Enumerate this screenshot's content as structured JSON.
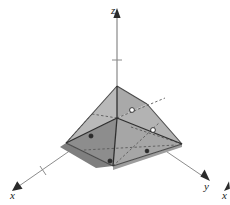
{
  "figure": {
    "kind": "3d-solid-diagram",
    "caption": "",
    "background_color": "#ffffff",
    "width": 230,
    "height": 205
  },
  "axes": {
    "origin": {
      "x": 117,
      "y": 118
    },
    "items": [
      {
        "name": "z",
        "label": "z",
        "label_pos": {
          "x": 111,
          "y": 14
        },
        "line": {
          "x1": 117,
          "y1": 118,
          "x2": 117,
          "y2": 17
        },
        "arrow_points": "117,8 113.4,18 120.6,18",
        "ticks": [
          {
            "x1": 112,
            "y1": 60,
            "x2": 122,
            "y2": 60
          }
        ]
      },
      {
        "name": "x",
        "label": "x",
        "label_pos": {
          "x": 10,
          "y": 199
        },
        "line": {
          "x1": 117,
          "y1": 118,
          "x2": 19,
          "y2": 186
        },
        "arrow_points": "12,191 22.6,188.8 17.2,181.2",
        "ticks": [
          {
            "x1": 40,
            "y1": 166,
            "x2": 46,
            "y2": 175
          }
        ]
      },
      {
        "name": "y",
        "label": "y",
        "label_pos": {
          "x": 204,
          "y": 190
        },
        "line": {
          "x1": 117,
          "y1": 118,
          "x2": 204,
          "y2": 177
        },
        "arrow_points": "210,181 200.4,176.6 204.6,169.4",
        "ticks": []
      },
      {
        "name": "x-clipped-neighbor",
        "label": "x",
        "label_pos": {
          "x": 222,
          "y": 199
        },
        "line": {
          "x1": 229,
          "y1": 186,
          "x2": 229,
          "y2": 186
        },
        "arrow_points": "224,191 229.9,188.8 229,181.2",
        "ticks": []
      }
    ],
    "axis_color": "#8c8c8c",
    "arrow_color": "#2b2b2b"
  },
  "solid": {
    "name": "shaded-pyramid",
    "vertices": {
      "apex": {
        "x": 117,
        "y": 86
      },
      "left": {
        "x": 66,
        "y": 143
      },
      "front": {
        "x": 113,
        "y": 166
      },
      "right": {
        "x": 182,
        "y": 144
      },
      "back": {
        "x": 147,
        "y": 104
      },
      "origin": {
        "x": 117,
        "y": 118
      }
    },
    "faces": [
      {
        "name": "face-upper-left",
        "points": "117,86 66,143 117,118",
        "color": "#b9b9b9"
      },
      {
        "name": "face-upper-back",
        "points": "117,86 147,104 117,118",
        "color": "#a9a9a9"
      },
      {
        "name": "face-upper-right",
        "points": "147,104 182,144 117,118",
        "color": "#b3b3b3"
      },
      {
        "name": "face-lower-left",
        "points": "66,143 113,166 117,118",
        "color": "#8d8d8d"
      },
      {
        "name": "face-lower-right",
        "points": "113,166 182,144 117,118",
        "color": "#a6a6a6"
      },
      {
        "name": "face-base-strip-left",
        "points": "66,143 113,166 96,168 60,147",
        "color": "#7f7f7f"
      },
      {
        "name": "face-base-strip-right",
        "points": "113,166 182,144 182,147 113,170",
        "color": "#9d9d9d"
      }
    ],
    "visible_edges": [
      {
        "name": "edge-apex-left",
        "x1": 117,
        "y1": 86,
        "x2": 66,
        "y2": 143
      },
      {
        "name": "edge-apex-back",
        "x1": 117,
        "y1": 86,
        "x2": 147,
        "y2": 104
      },
      {
        "name": "edge-back-right",
        "x1": 147,
        "y1": 104,
        "x2": 182,
        "y2": 144
      },
      {
        "name": "edge-left-front",
        "x1": 66,
        "y1": 143,
        "x2": 113,
        "y2": 166
      },
      {
        "name": "edge-front-right",
        "x1": 113,
        "y1": 166,
        "x2": 182,
        "y2": 144
      },
      {
        "name": "edge-apex-origin",
        "x1": 117,
        "y1": 86,
        "x2": 117,
        "y2": 118
      },
      {
        "name": "edge-origin-front",
        "x1": 117,
        "y1": 118,
        "x2": 113,
        "y2": 166
      },
      {
        "name": "edge-origin-right",
        "x1": 117,
        "y1": 118,
        "x2": 182,
        "y2": 144
      },
      {
        "name": "edge-origin-left",
        "x1": 117,
        "y1": 118,
        "x2": 66,
        "y2": 143
      }
    ],
    "hidden_edges": [
      {
        "name": "hidden-edge-midline-left",
        "x1": 92,
        "y1": 114,
        "x2": 117,
        "y2": 118
      },
      {
        "name": "hidden-edge-left-upper",
        "x1": 92,
        "y1": 114,
        "x2": 66,
        "y2": 143
      },
      {
        "name": "hidden-edge-diag-back",
        "x1": 117,
        "y1": 118,
        "x2": 165,
        "y2": 98
      },
      {
        "name": "hidden-edge-cut-right",
        "x1": 131,
        "y1": 127,
        "x2": 182,
        "y2": 144
      },
      {
        "name": "hidden-edge-base-long",
        "x1": 84,
        "y1": 150,
        "x2": 176,
        "y2": 145
      },
      {
        "name": "hidden-edge-base-front",
        "x1": 113,
        "y1": 166,
        "x2": 160,
        "y2": 122
      }
    ],
    "markers": [
      {
        "name": "midpoint-marker-1",
        "x": 132,
        "y": 110,
        "r": 2.4,
        "style": "open"
      },
      {
        "name": "midpoint-marker-2",
        "x": 153,
        "y": 130,
        "r": 2.4,
        "style": "open"
      },
      {
        "name": "midpoint-marker-3",
        "x": 91,
        "y": 136,
        "r": 2.1,
        "style": "filled"
      },
      {
        "name": "midpoint-marker-4",
        "x": 110,
        "y": 161,
        "r": 2.1,
        "style": "filled"
      },
      {
        "name": "midpoint-marker-5",
        "x": 147,
        "y": 151,
        "r": 1.9,
        "style": "filled"
      }
    ],
    "colors": {
      "face_light": "#b9b9b9",
      "face_mid": "#a6a6a6",
      "face_dark": "#8d8d8d",
      "edge": "#4a4a4a",
      "hidden_edge": "#595959"
    }
  }
}
